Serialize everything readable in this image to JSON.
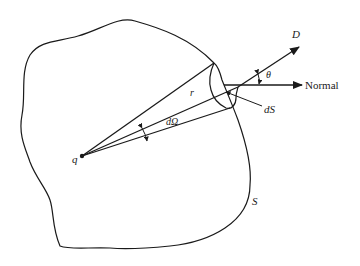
{
  "diagram": {
    "labels": {
      "charge": "q",
      "radius": "r",
      "solid_angle": "dΩ",
      "field": "D",
      "angle": "θ",
      "normal": "Normal",
      "surface_element": "dS",
      "surface": "S"
    },
    "colors": {
      "stroke": "#1a1a1a",
      "background": "#ffffff"
    }
  }
}
